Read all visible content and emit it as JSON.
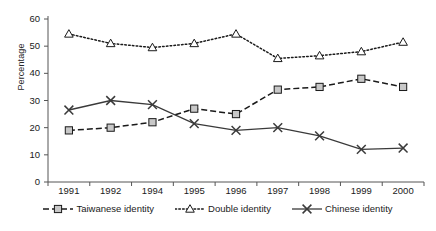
{
  "chart_data": {
    "type": "line",
    "title": "",
    "xlabel": "",
    "ylabel": "Percentage",
    "ylim": [
      0,
      60
    ],
    "ytick_step": 10,
    "grid": false,
    "legend_position": "bottom",
    "categories": [
      "1991",
      "1992",
      "1994",
      "1995",
      "1996",
      "1997",
      "1998",
      "1999",
      "2000"
    ],
    "ytick_labels": [
      "60",
      "50",
      "40",
      "30",
      "20",
      "10",
      "0"
    ],
    "ytick_values": [
      60,
      50,
      40,
      30,
      20,
      10,
      0
    ],
    "series": [
      {
        "name": "Taiwanese identity",
        "marker": "square",
        "line_style": "dashed",
        "color": "#1a1a1a",
        "marker_fill": "#c8c8c8",
        "values": [
          19,
          20,
          22,
          27,
          25,
          34,
          35,
          38,
          35
        ]
      },
      {
        "name": "Double identity",
        "marker": "triangle",
        "line_style": "dotted",
        "color": "#1a1a1a",
        "marker_fill": "#ffffff",
        "values": [
          54.5,
          51,
          49.5,
          51,
          54.5,
          45.5,
          46.5,
          48,
          51.5
        ]
      },
      {
        "name": "Chinese identity",
        "marker": "x",
        "line_style": "solid",
        "color": "#3a3a3a",
        "marker_fill": "none",
        "values": [
          26.5,
          30,
          28.5,
          21.5,
          19,
          20,
          17,
          12,
          12.5
        ]
      }
    ]
  },
  "legend": {
    "items": [
      {
        "label": "Taiwanese identity"
      },
      {
        "label": "Double identity"
      },
      {
        "label": "Chinese identity"
      }
    ]
  }
}
